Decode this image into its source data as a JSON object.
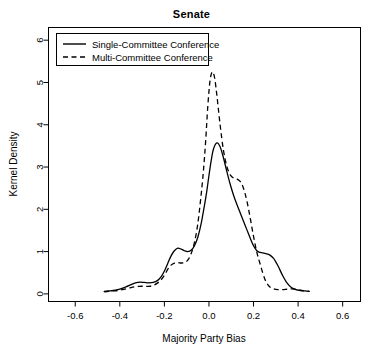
{
  "chart_data": {
    "type": "line",
    "title": "Senate",
    "xlabel": "Majority Party Bias",
    "ylabel": "Kernel Density",
    "xlim": [
      -0.72,
      0.68
    ],
    "ylim": [
      -0.18,
      6.3
    ],
    "xticks": [
      -0.6,
      -0.4,
      -0.2,
      0.0,
      0.2,
      0.4,
      0.6
    ],
    "xtick_labels": [
      "-0.6",
      "-0.4",
      "-0.2",
      "0.0",
      "0.2",
      "0.4",
      "0.6"
    ],
    "yticks": [
      0,
      1,
      2,
      3,
      4,
      5,
      6
    ],
    "ytick_labels": [
      "0",
      "1",
      "2",
      "3",
      "4",
      "5",
      "6"
    ],
    "grid": false,
    "legend_position": "top-left",
    "series": [
      {
        "name": "Single-Committee Conference",
        "style": "solid",
        "color": "#000000",
        "x": [
          -0.47,
          -0.45,
          -0.43,
          -0.41,
          -0.39,
          -0.37,
          -0.35,
          -0.33,
          -0.31,
          -0.29,
          -0.27,
          -0.25,
          -0.23,
          -0.215,
          -0.2,
          -0.185,
          -0.17,
          -0.155,
          -0.14,
          -0.125,
          -0.11,
          -0.095,
          -0.08,
          -0.065,
          -0.05,
          -0.035,
          -0.02,
          -0.01,
          0.0,
          0.01,
          0.02,
          0.035,
          0.05,
          0.065,
          0.08,
          0.095,
          0.11,
          0.125,
          0.14,
          0.155,
          0.17,
          0.185,
          0.2,
          0.215,
          0.23,
          0.25,
          0.27,
          0.29,
          0.31,
          0.33,
          0.35,
          0.37,
          0.39,
          0.41,
          0.43,
          0.45
        ],
        "y": [
          0.06,
          0.07,
          0.08,
          0.1,
          0.13,
          0.17,
          0.22,
          0.26,
          0.28,
          0.27,
          0.26,
          0.27,
          0.32,
          0.4,
          0.54,
          0.72,
          0.9,
          1.02,
          1.08,
          1.06,
          1.02,
          1.0,
          1.03,
          1.14,
          1.34,
          1.66,
          2.1,
          2.42,
          2.8,
          3.15,
          3.42,
          3.57,
          3.48,
          3.22,
          2.9,
          2.6,
          2.34,
          2.12,
          1.92,
          1.72,
          1.52,
          1.32,
          1.14,
          1.02,
          0.98,
          0.96,
          0.93,
          0.84,
          0.66,
          0.44,
          0.26,
          0.15,
          0.1,
          0.08,
          0.07,
          0.06
        ]
      },
      {
        "name": "Multi-Committee Conference",
        "style": "dashed",
        "color": "#000000",
        "x": [
          -0.47,
          -0.45,
          -0.43,
          -0.41,
          -0.39,
          -0.37,
          -0.35,
          -0.33,
          -0.31,
          -0.29,
          -0.27,
          -0.25,
          -0.23,
          -0.215,
          -0.2,
          -0.185,
          -0.17,
          -0.155,
          -0.14,
          -0.125,
          -0.11,
          -0.095,
          -0.08,
          -0.065,
          -0.05,
          -0.035,
          -0.025,
          -0.015,
          -0.005,
          0.005,
          0.015,
          0.025,
          0.035,
          0.05,
          0.065,
          0.08,
          0.095,
          0.11,
          0.125,
          0.14,
          0.155,
          0.17,
          0.185,
          0.2,
          0.215,
          0.23,
          0.25,
          0.27,
          0.29,
          0.31,
          0.33,
          0.35,
          0.37,
          0.39,
          0.41,
          0.43,
          0.45
        ],
        "y": [
          0.05,
          0.06,
          0.07,
          0.08,
          0.1,
          0.12,
          0.15,
          0.17,
          0.18,
          0.18,
          0.18,
          0.2,
          0.26,
          0.33,
          0.44,
          0.58,
          0.68,
          0.73,
          0.74,
          0.73,
          0.74,
          0.8,
          0.95,
          1.22,
          1.66,
          2.35,
          2.9,
          3.6,
          4.45,
          5.05,
          5.25,
          5.12,
          4.72,
          4.0,
          3.4,
          3.02,
          2.82,
          2.74,
          2.72,
          2.66,
          2.5,
          2.2,
          1.8,
          1.36,
          0.98,
          0.7,
          0.36,
          0.18,
          0.12,
          0.1,
          0.1,
          0.11,
          0.12,
          0.11,
          0.09,
          0.07,
          0.06
        ]
      }
    ]
  },
  "legend": {
    "entries": [
      {
        "label": "Single-Committee Conference"
      },
      {
        "label": "Multi-Committee Conference"
      }
    ]
  }
}
